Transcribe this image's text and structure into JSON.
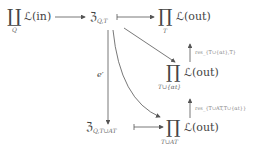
{
  "nodes": {
    "prod_in": {
      "symbol": "∐",
      "sub": "Q",
      "text": "ℒ(in)"
    },
    "frak_qt": {
      "text": "ℨ",
      "sub": "Q,T"
    },
    "prod_out_t": {
      "symbol": "∏",
      "sub": "T",
      "text": "ℒ(out)"
    },
    "prod_out_talpha": {
      "symbol": "∏",
      "sub": "T∪{αt}",
      "text": "ℒ(out)"
    },
    "frak_qtat": {
      "text": "ℨ",
      "sub": "Q,T∪AT"
    },
    "prod_out_tat": {
      "symbol": "∏",
      "sub": "T∪AT",
      "text": "ℒ(out)"
    }
  },
  "arrows": {
    "e_prime": "e′",
    "res1": "res_{T∪{αt},T}",
    "res2": "res_{T∪AT,T∪{αt}}"
  }
}
